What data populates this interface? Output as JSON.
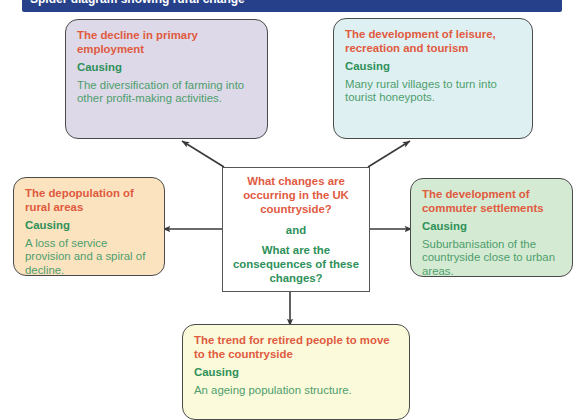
{
  "title_bar": {
    "text": "Spider diagram showing rural change"
  },
  "colors": {
    "title_bar": "#26418a",
    "node_title": "#e05a3f",
    "causing_label": "#2e9159",
    "body_text": "#4d9e6d",
    "arrow": "#3a3a3a",
    "node_border": "#4a4a4a",
    "fill_primary_employment": "#ddd9e8",
    "fill_leisure_tourism": "#dff0f2",
    "fill_depopulation": "#fbe3c0",
    "fill_commuter_settlements": "#d5ead2",
    "fill_retired_migration": "#fbfadb",
    "fill_central": "#ffffff"
  },
  "central": {
    "question_primary": "What changes are occurring in the UK countryside?",
    "conjunction": "and",
    "question_secondary": "What are the consequences of these changes?"
  },
  "causing_label": "Causing",
  "nodes": [
    {
      "id": "primary-employment",
      "title": "The decline in primary employment",
      "causing": "Causing",
      "body": "The diversification of farming into other profit-making activities."
    },
    {
      "id": "leisure-tourism",
      "title": "The development of leisure, recreation and tourism",
      "causing": "Causing",
      "body": "Many rural villages to turn into tourist honeypots."
    },
    {
      "id": "depopulation",
      "title": "The depopulation of rural areas",
      "causing": "Causing",
      "body": "A loss of service provision and a spiral of decline."
    },
    {
      "id": "commuter-settlements",
      "title": "The development of commuter settlements",
      "causing": "Causing",
      "body": "Suburbanisation of the countryside close to urban areas."
    },
    {
      "id": "retired-migration",
      "title": "The trend for retired people to move to the countryside",
      "causing": "Causing",
      "body": "An ageing population structure."
    }
  ],
  "arrows": [
    {
      "id": "arrow-to-primary-employment",
      "direction": "up-left",
      "from": "central",
      "to": "primary-employment"
    },
    {
      "id": "arrow-to-leisure-tourism",
      "direction": "up-right",
      "from": "central",
      "to": "leisure-tourism"
    },
    {
      "id": "arrow-to-depopulation",
      "direction": "left",
      "from": "central",
      "to": "depopulation"
    },
    {
      "id": "arrow-to-commuter",
      "direction": "right",
      "from": "central",
      "to": "commuter-settlements"
    },
    {
      "id": "arrow-to-retired",
      "direction": "down",
      "from": "central",
      "to": "retired-migration"
    }
  ]
}
